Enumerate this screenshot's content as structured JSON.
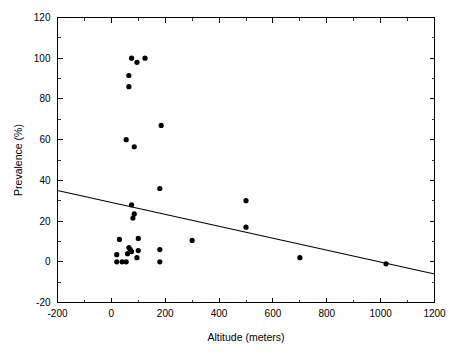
{
  "chart_data": {
    "type": "scatter",
    "title": "",
    "xlabel": "Altitude (meters)",
    "ylabel": "Prevalence (%)",
    "xlim": [
      -200,
      1200
    ],
    "ylim": [
      -20,
      120
    ],
    "x_ticks": [
      -200,
      0,
      200,
      400,
      600,
      800,
      1000,
      1200
    ],
    "y_ticks": [
      -20,
      0,
      20,
      40,
      60,
      80,
      100,
      120
    ],
    "x_tick_labels": [
      "-200",
      "0",
      "200",
      "400",
      "600",
      "800",
      "1000",
      "1200"
    ],
    "y_tick_labels": [
      "-20",
      "0",
      "20",
      "40",
      "60",
      "80",
      "100",
      "120"
    ],
    "x_minor_step": 100,
    "y_minor_step": 10,
    "grid": false,
    "legend": null,
    "marker": "filled-circle",
    "marker_color": "#000000",
    "points": [
      {
        "x": 75,
        "y": 100.0
      },
      {
        "x": 95,
        "y": 98.0
      },
      {
        "x": 125,
        "y": 100.0
      },
      {
        "x": 65,
        "y": 91.5
      },
      {
        "x": 65,
        "y": 86.0
      },
      {
        "x": 185,
        "y": 67.0
      },
      {
        "x": 55,
        "y": 60.0
      },
      {
        "x": 85,
        "y": 56.5
      },
      {
        "x": 180,
        "y": 36.0
      },
      {
        "x": 75,
        "y": 28.0
      },
      {
        "x": 85,
        "y": 23.5
      },
      {
        "x": 80,
        "y": 21.5
      },
      {
        "x": 500,
        "y": 30.0
      },
      {
        "x": 500,
        "y": 17.0
      },
      {
        "x": 100,
        "y": 11.5
      },
      {
        "x": 30,
        "y": 11.0
      },
      {
        "x": 300,
        "y": 10.5
      },
      {
        "x": 65,
        "y": 7.0
      },
      {
        "x": 70,
        "y": 6.0
      },
      {
        "x": 75,
        "y": 5.0
      },
      {
        "x": 100,
        "y": 5.5
      },
      {
        "x": 180,
        "y": 6.0
      },
      {
        "x": 20,
        "y": 3.5
      },
      {
        "x": 60,
        "y": 4.0
      },
      {
        "x": 95,
        "y": 2.0
      },
      {
        "x": 700,
        "y": 2.0
      },
      {
        "x": 20,
        "y": 0.0
      },
      {
        "x": 40,
        "y": 0.0
      },
      {
        "x": 55,
        "y": 0.0
      },
      {
        "x": 180,
        "y": 0.0
      },
      {
        "x": 1020,
        "y": -1.0
      }
    ],
    "trendline": {
      "type": "linear-fit",
      "x_start": -200,
      "y_start": 35.0,
      "x_end": 1200,
      "y_end": -6.0
    }
  }
}
